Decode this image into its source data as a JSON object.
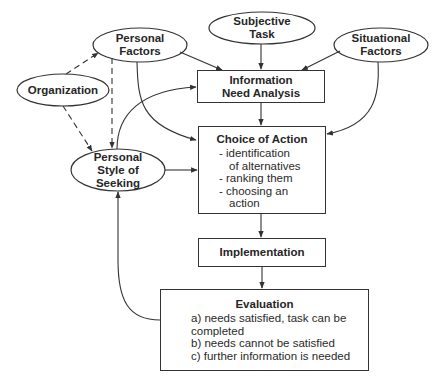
{
  "nodes": {
    "personal_factors": {
      "lines": [
        "Personal",
        "Factors"
      ]
    },
    "subjective_task": {
      "lines": [
        "Subjective",
        "Task"
      ]
    },
    "situational_factors": {
      "lines": [
        "Situational",
        "Factors"
      ]
    },
    "organization": {
      "lines": [
        "Organization"
      ]
    },
    "information_need_analysis": {
      "lines": [
        "Information",
        "Need Analysis"
      ]
    },
    "personal_style_of_seeking": {
      "lines": [
        "Personal",
        "Style of",
        "Seeking"
      ]
    },
    "choice_of_action": {
      "title": "Choice of Action",
      "items": [
        "- identification",
        "  of alternatives",
        "- ranking them",
        "- choosing an",
        "  action"
      ]
    },
    "implementation": {
      "title": "Implementation"
    },
    "evaluation": {
      "title": "Evaluation",
      "items": [
        "a) needs satisfied, task can be",
        "completed",
        "b) needs cannot be satisfied",
        "c) further information is needed"
      ]
    }
  },
  "edges": [
    {
      "from": "Personal Factors",
      "to": "Information Need Analysis",
      "style": "solid"
    },
    {
      "from": "Subjective Task",
      "to": "Information Need Analysis",
      "style": "solid"
    },
    {
      "from": "Situational Factors",
      "to": "Information Need Analysis",
      "style": "solid"
    },
    {
      "from": "Personal Factors",
      "to": "Choice of Action",
      "style": "solid"
    },
    {
      "from": "Situational Factors",
      "to": "Choice of Action",
      "style": "solid"
    },
    {
      "from": "Organization",
      "to": "Personal Factors",
      "style": "dashed"
    },
    {
      "from": "Organization",
      "to": "Personal Style of Seeking",
      "style": "dashed"
    },
    {
      "from": "Personal Factors",
      "to": "Personal Style of Seeking",
      "style": "dashed"
    },
    {
      "from": "Personal Style of Seeking",
      "to": "Information Need Analysis",
      "style": "solid"
    },
    {
      "from": "Personal Style of Seeking",
      "to": "Choice of Action",
      "style": "solid"
    },
    {
      "from": "Information Need Analysis",
      "to": "Choice of Action",
      "style": "solid"
    },
    {
      "from": "Choice of Action",
      "to": "Implementation",
      "style": "solid"
    },
    {
      "from": "Implementation",
      "to": "Evaluation",
      "style": "solid"
    },
    {
      "from": "Evaluation",
      "to": "Personal Style of Seeking",
      "style": "solid"
    }
  ]
}
